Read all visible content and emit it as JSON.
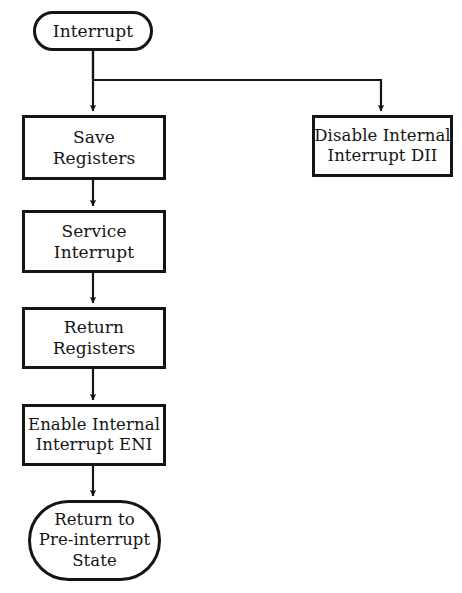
{
  "diagram": {
    "background_color": "#ffffff",
    "line_color": "#151515",
    "text_color": "#151515",
    "nodes": {
      "start": {
        "shape": "terminal",
        "line1": "Interrupt"
      },
      "save_registers": {
        "shape": "process",
        "line1": "Save",
        "line2": "Registers"
      },
      "service_interrupt": {
        "shape": "process",
        "line1": "Service",
        "line2": "Interrupt"
      },
      "return_registers": {
        "shape": "process",
        "line1": "Return",
        "line2": "Registers"
      },
      "enable_interrupt": {
        "shape": "process",
        "line1": "Enable Internal",
        "line2": "Interrupt ENI"
      },
      "end": {
        "shape": "terminal",
        "line1": "Return to",
        "line2": "Pre-interrupt",
        "line3": "State"
      },
      "disable_interrupt": {
        "shape": "process",
        "line1": "Disable Internal",
        "line2": "Interrupt DII"
      }
    },
    "edges": [
      {
        "name": "start-to-save",
        "from": "start",
        "to": "save_registers"
      },
      {
        "name": "start-to-disable",
        "from": "start",
        "to": "disable_interrupt"
      },
      {
        "name": "save-to-service",
        "from": "save_registers",
        "to": "service_interrupt"
      },
      {
        "name": "service-to-return",
        "from": "service_interrupt",
        "to": "return_registers"
      },
      {
        "name": "return-to-enable",
        "from": "return_registers",
        "to": "enable_interrupt"
      },
      {
        "name": "enable-to-end",
        "from": "enable_interrupt",
        "to": "end"
      }
    ]
  }
}
